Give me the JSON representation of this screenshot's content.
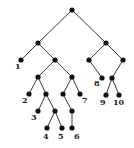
{
  "diagram": {
    "type": "binary-tree",
    "nodes": [
      {
        "id": "root",
        "label": ""
      },
      {
        "id": "a",
        "label": ""
      },
      {
        "id": "b",
        "label": ""
      },
      {
        "id": "leaf1",
        "label": "1"
      },
      {
        "id": "c",
        "label": ""
      },
      {
        "id": "d",
        "label": ""
      },
      {
        "id": "e",
        "label": ""
      },
      {
        "id": "leaf2",
        "label": "2"
      },
      {
        "id": "f",
        "label": ""
      },
      {
        "id": "leaf3",
        "label": "3"
      },
      {
        "id": "g",
        "label": ""
      },
      {
        "id": "leaf4",
        "label": "4"
      },
      {
        "id": "leaf5",
        "label": "5"
      },
      {
        "id": "h",
        "label": ""
      },
      {
        "id": "leaf7",
        "label": "7"
      },
      {
        "id": "i",
        "label": ""
      },
      {
        "id": "leaf6",
        "label": "6"
      },
      {
        "id": "j",
        "label": ""
      },
      {
        "id": "k",
        "label": ""
      },
      {
        "id": "leaf8",
        "label": "8"
      },
      {
        "id": "l",
        "label": ""
      },
      {
        "id": "leaf9",
        "label": "9"
      },
      {
        "id": "leaf10",
        "label": "10"
      }
    ],
    "edges": [
      [
        "root",
        "a"
      ],
      [
        "root",
        "b"
      ],
      [
        "a",
        "leaf1"
      ],
      [
        "a",
        "c"
      ],
      [
        "c",
        "d"
      ],
      [
        "c",
        "e"
      ],
      [
        "d",
        "leaf2"
      ],
      [
        "d",
        "f"
      ],
      [
        "f",
        "leaf3"
      ],
      [
        "f",
        "g"
      ],
      [
        "g",
        "leaf4"
      ],
      [
        "g",
        "leaf5"
      ],
      [
        "e",
        "h"
      ],
      [
        "e",
        "leaf7"
      ],
      [
        "h",
        "i"
      ],
      [
        "i",
        "leaf6"
      ],
      [
        "b",
        "j"
      ],
      [
        "b",
        "k"
      ],
      [
        "j",
        "leaf8"
      ],
      [
        "k",
        "l"
      ],
      [
        "l",
        "leaf9"
      ],
      [
        "l",
        "leaf10"
      ]
    ]
  }
}
